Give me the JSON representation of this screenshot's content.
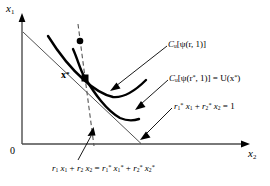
{
  "figure": {
    "type": "economics-duality-diagram",
    "background": "#ffffff",
    "ink": "#000000",
    "axes": {
      "y_axis_label": "x",
      "y_axis_sub": "1",
      "x_axis_label": "x",
      "x_axis_sub": "2",
      "origin_label": "0",
      "x_axis_y_px": 144,
      "y_axis_x_px": 22
    },
    "point_label": {
      "name": "x-star-point",
      "text": "x",
      "star": "*"
    },
    "annotations": {
      "cost_function_r": {
        "prefix": "C",
        "sub": "u",
        "body": "[ψ(r, 1)]"
      },
      "cost_function_rstar": {
        "prefix": "C",
        "sub": "u",
        "body_a": "[ψ(r",
        "star_a": "*",
        "body_b": ", 1)] = U(x",
        "star_b": "*",
        "body_c": ")"
      },
      "budget_line_star": {
        "r1": "r",
        "r1sub": "1",
        "r1star": "*",
        "x1": " x",
        "x1sub": "1",
        "plus": " + ",
        "r2": "r",
        "r2sub": "2",
        "r2star": "*",
        "x2": " x",
        "x2sub": "2",
        "eq": " = 1"
      },
      "budget_line_tangent": {
        "lhs_r1": "r",
        "lhs_r1sub": "1",
        "lhs_x1": " x",
        "lhs_x1sub": "1",
        "plus1": " + ",
        "lhs_r2": "r",
        "lhs_r2sub": "2",
        "lhs_x2": " x",
        "lhs_x2sub": "2",
        "equals": " = ",
        "rhs_r1": "r",
        "rhs_r1sub": "1",
        "rhs_r1star": "*",
        "rhs_x1": " x",
        "rhs_x1sub": "1",
        "rhs_x1star": "*",
        "plus2": " + ",
        "rhs_r2": "r",
        "rhs_r2sub": "2",
        "rhs_r2star": "*",
        "rhs_x2": " x",
        "rhs_x2sub": "2",
        "rhs_x2star": "*"
      }
    }
  }
}
